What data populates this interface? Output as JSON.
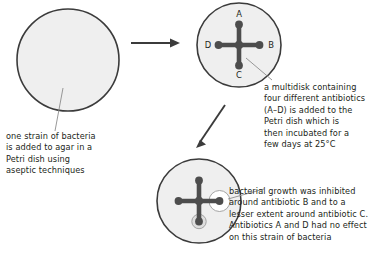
{
  "diagram": {
    "colors": {
      "agar_fill": "#efefef",
      "dish_stroke": "#3b3b3b",
      "multidisk": "#4d4d4d",
      "inhibition_zone": "#ffffff",
      "text": "#231f20",
      "leader_line": "#8c8c8c",
      "arrow": "#3b3b3b"
    },
    "stages": [
      {
        "id": "stage-1",
        "name": "inoculated-petri-dish",
        "has_multidisk": false,
        "caption_ref": "captions.0"
      },
      {
        "id": "stage-2",
        "name": "petri-dish-with-multidisk",
        "has_multidisk": true,
        "caption_ref": "captions.1"
      },
      {
        "id": "stage-3",
        "name": "petri-dish-after-incubation",
        "has_multidisk": true,
        "caption_ref": "captions.2"
      }
    ],
    "multidisk": {
      "label": "multidisk",
      "arms": [
        {
          "id": "A",
          "label": "A",
          "position": "top",
          "antibiotic": "A",
          "inhibition": "none"
        },
        {
          "id": "B",
          "label": "B",
          "position": "right",
          "antibiotic": "B",
          "inhibition": "large"
        },
        {
          "id": "C",
          "label": "C",
          "position": "bottom",
          "antibiotic": "C",
          "inhibition": "small"
        },
        {
          "id": "D",
          "label": "D",
          "position": "left",
          "antibiotic": "D",
          "inhibition": "none"
        }
      ]
    },
    "arrows": [
      {
        "id": "arrow-1",
        "name": "arrow-stage1-to-stage2",
        "direction": "right"
      },
      {
        "id": "arrow-2",
        "name": "arrow-stage2-to-stage3",
        "direction": "down-left"
      }
    ],
    "captions": [
      {
        "id": "caption-strain",
        "name": "caption-one-strain-of-bacteria",
        "text": "one strain of bacteria\nis added to agar in a\nPetri dish using\naseptic techniques"
      },
      {
        "id": "caption-multidisk",
        "name": "caption-multidisk-added",
        "text": "a multidisk containing\nfour different antibiotics\n(A–D) is added to the\nPetri dish which is\nthen incubated for a\nfew days at 25°C"
      },
      {
        "id": "caption-results",
        "name": "caption-inhibition-results",
        "text": "bacterial growth was inhibited\naround antibiotic B and to a\nlesser extent around antibiotic C.\nAntibiotics A and D had no effect\non this strain of bacteria"
      }
    ]
  }
}
